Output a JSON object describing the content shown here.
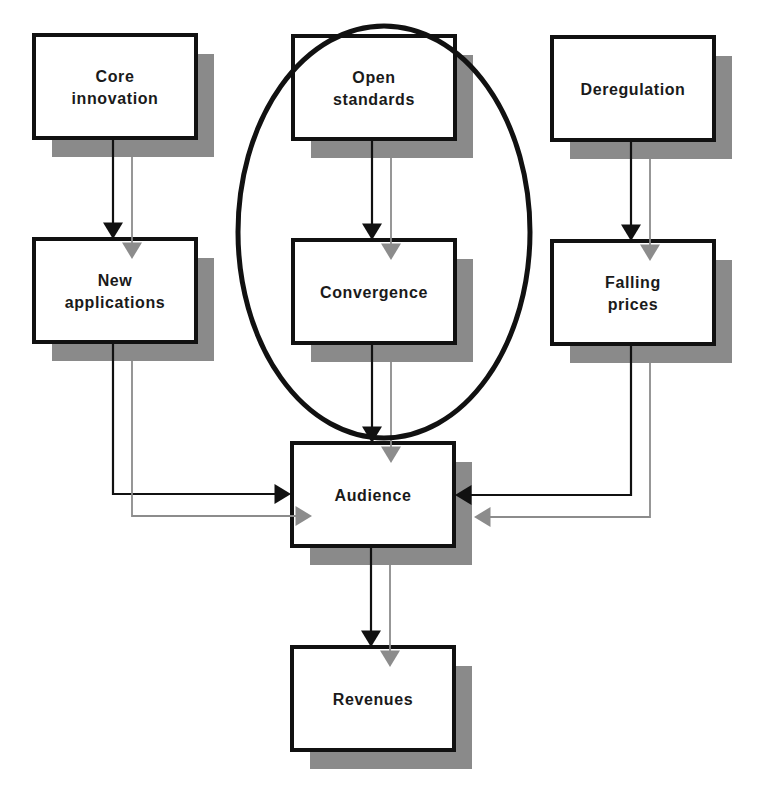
{
  "diagram": {
    "type": "flowchart",
    "colors": {
      "box_border": "#111111",
      "box_fill": "#ffffff",
      "shadow": "#8a8a8a",
      "primary_arrow": "#111111",
      "secondary_arrow": "#8c8c8c",
      "highlight_ellipse": "#111111"
    },
    "nodes": [
      {
        "id": "core",
        "lines": [
          "Core",
          "innovation"
        ]
      },
      {
        "id": "open",
        "lines": [
          "Open",
          "standards"
        ]
      },
      {
        "id": "dereg",
        "lines": [
          "Deregulation"
        ]
      },
      {
        "id": "newapps",
        "lines": [
          "New",
          "applications"
        ]
      },
      {
        "id": "conv",
        "lines": [
          "Convergence"
        ]
      },
      {
        "id": "falling",
        "lines": [
          "Falling",
          "prices"
        ]
      },
      {
        "id": "audience",
        "lines": [
          "Audience"
        ]
      },
      {
        "id": "revenues",
        "lines": [
          "Revenues"
        ]
      }
    ],
    "edges": [
      {
        "from": "core",
        "to": "newapps"
      },
      {
        "from": "open",
        "to": "conv"
      },
      {
        "from": "dereg",
        "to": "falling"
      },
      {
        "from": "newapps",
        "to": "audience"
      },
      {
        "from": "conv",
        "to": "audience"
      },
      {
        "from": "falling",
        "to": "audience"
      },
      {
        "from": "audience",
        "to": "revenues"
      }
    ],
    "highlight": {
      "encloses": [
        "open",
        "conv"
      ],
      "shape": "ellipse"
    }
  }
}
